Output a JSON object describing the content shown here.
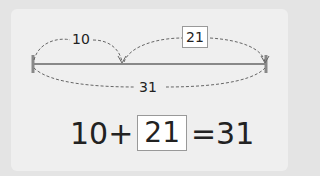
{
  "diagram": {
    "part_a": "10",
    "part_b": "21",
    "total": "31"
  },
  "equation": {
    "addend_a": "10",
    "plus": "+",
    "addend_b": "21",
    "equals": "=",
    "sum": "31"
  },
  "colors": {
    "line": "#888888",
    "dash": "#777777",
    "box_border": "#999999"
  }
}
